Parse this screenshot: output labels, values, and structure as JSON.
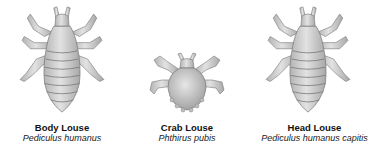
{
  "figures": [
    {
      "common_name": "Body Louse",
      "scientific_name": "Pediculus humanus",
      "icon": "body-louse-illustration"
    },
    {
      "common_name": "Crab Louse",
      "scientific_name": "Phthirus pubis",
      "icon": "crab-louse-illustration"
    },
    {
      "common_name": "Head Louse",
      "scientific_name": "Pediculus humanus capitis",
      "icon": "head-louse-illustration"
    }
  ],
  "colors": {
    "body_fill": "#c8c8c8",
    "body_shade": "#9a9a9a",
    "outline": "#6e6e6e",
    "text": "#111111"
  }
}
